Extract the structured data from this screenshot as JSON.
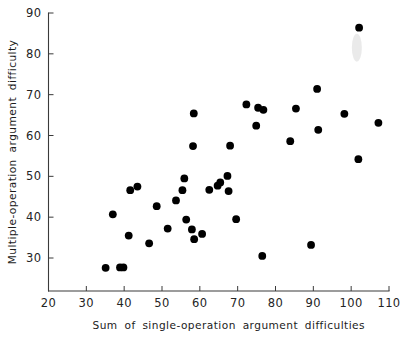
{
  "chart_data": {
    "type": "scatter",
    "title": "",
    "xlabel": "Sum of single-operation argument difficulties",
    "ylabel": "Multiple-operation argument difficulty",
    "xlim": [
      20,
      110
    ],
    "ylim": [
      20,
      90
    ],
    "xticks": [
      20,
      30,
      40,
      50,
      60,
      70,
      80,
      90,
      100,
      110
    ],
    "yticks": [
      30,
      40,
      50,
      60,
      70,
      80,
      90
    ],
    "xtick_labels": [
      "20",
      "30",
      "40",
      "50",
      "60",
      "70",
      "80",
      "90",
      "100",
      "110"
    ],
    "ytick_labels": [
      "30",
      "40",
      "50",
      "60",
      "70",
      "80",
      "90"
    ],
    "grid": false,
    "legend": null,
    "marker": "filled-circle",
    "marker_color": "#000000",
    "marker_size_px": 5.4,
    "points": [
      {
        "x": 35.1,
        "y": 27.6
      },
      {
        "x": 38.9,
        "y": 27.7
      },
      {
        "x": 39.8,
        "y": 27.7
      },
      {
        "x": 37.0,
        "y": 40.7
      },
      {
        "x": 41.2,
        "y": 35.5
      },
      {
        "x": 41.6,
        "y": 46.6
      },
      {
        "x": 43.5,
        "y": 47.5
      },
      {
        "x": 46.6,
        "y": 33.6
      },
      {
        "x": 48.6,
        "y": 42.7
      },
      {
        "x": 51.5,
        "y": 37.2
      },
      {
        "x": 53.7,
        "y": 44.1
      },
      {
        "x": 55.4,
        "y": 46.6
      },
      {
        "x": 55.9,
        "y": 49.5
      },
      {
        "x": 56.4,
        "y": 39.4
      },
      {
        "x": 57.9,
        "y": 37.0
      },
      {
        "x": 58.2,
        "y": 57.4
      },
      {
        "x": 58.4,
        "y": 65.4
      },
      {
        "x": 58.5,
        "y": 34.6
      },
      {
        "x": 60.6,
        "y": 35.9
      },
      {
        "x": 62.5,
        "y": 46.7
      },
      {
        "x": 64.7,
        "y": 47.7
      },
      {
        "x": 65.4,
        "y": 48.5
      },
      {
        "x": 67.3,
        "y": 50.1
      },
      {
        "x": 67.6,
        "y": 46.4
      },
      {
        "x": 68.0,
        "y": 57.5
      },
      {
        "x": 69.6,
        "y": 39.5
      },
      {
        "x": 72.3,
        "y": 67.6
      },
      {
        "x": 74.9,
        "y": 62.4
      },
      {
        "x": 75.4,
        "y": 66.8
      },
      {
        "x": 76.8,
        "y": 66.3
      },
      {
        "x": 76.5,
        "y": 30.5
      },
      {
        "x": 83.9,
        "y": 58.6
      },
      {
        "x": 85.4,
        "y": 66.6
      },
      {
        "x": 89.4,
        "y": 33.2
      },
      {
        "x": 91.0,
        "y": 71.4
      },
      {
        "x": 91.3,
        "y": 61.4
      },
      {
        "x": 98.2,
        "y": 65.3
      },
      {
        "x": 101.9,
        "y": 54.2
      },
      {
        "x": 102.1,
        "y": 86.4
      },
      {
        "x": 107.2,
        "y": 63.1
      }
    ],
    "artifacts": [
      {
        "type": "scan-smudge",
        "x": 101.5,
        "y": 81.5,
        "color": "#d8d8d8"
      }
    ]
  },
  "figure": {
    "background": "#ffffff",
    "axis_color": "#3a3a3a",
    "text_color": "#1c1c1c"
  }
}
